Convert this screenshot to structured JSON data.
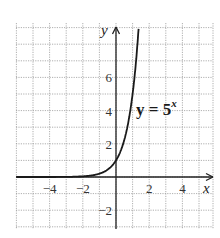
{
  "chart_data": {
    "type": "line",
    "title": "",
    "xlabel": "x",
    "ylabel": "y",
    "xlim": [
      -6,
      6
    ],
    "ylim": [
      -3,
      9
    ],
    "grid": true,
    "x_ticks": [
      -4,
      -2,
      2,
      4
    ],
    "x_tick_labels": [
      "−4",
      "−2",
      "2",
      "4"
    ],
    "y_ticks": [
      -2,
      2,
      4,
      6
    ],
    "y_tick_labels": [
      "−2",
      "2",
      "4",
      "6"
    ],
    "series": [
      {
        "name": "y = 5^x",
        "function": "5^x",
        "x": [
          -6,
          -4,
          -3,
          -2,
          -1.5,
          -1,
          -0.5,
          0,
          0.25,
          0.5,
          0.75,
          1,
          1.25,
          1.37
        ],
        "y": [
          1.28e-05,
          0.0016,
          0.008,
          0.04,
          0.089,
          0.2,
          0.447,
          1,
          1.495,
          2.236,
          3.344,
          5,
          7.477,
          9.06
        ]
      }
    ],
    "annotations": [
      {
        "text": "y = 5",
        "superscript": "x"
      }
    ]
  }
}
